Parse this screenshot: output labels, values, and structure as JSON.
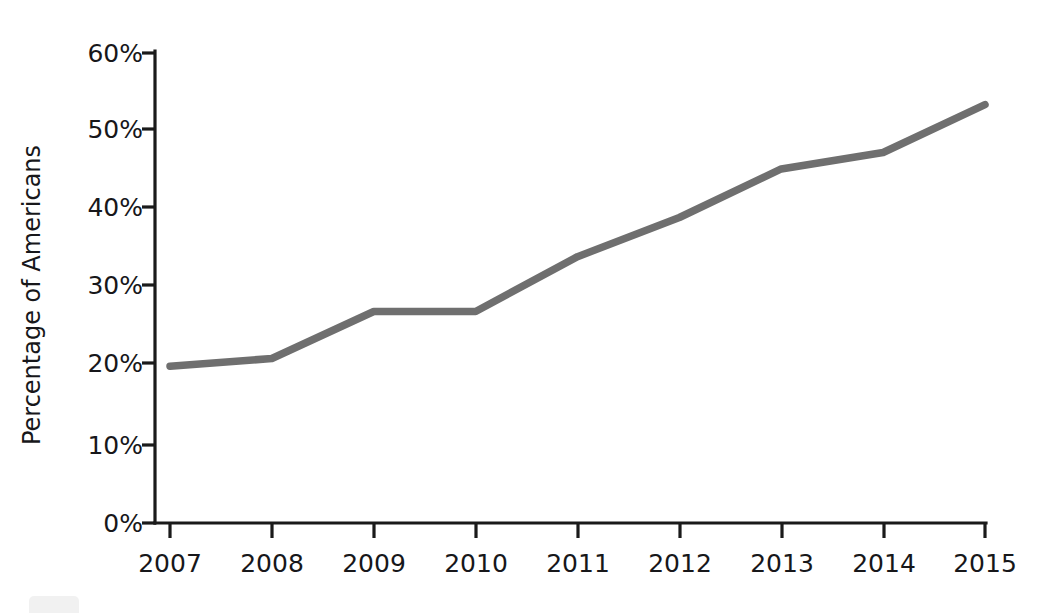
{
  "chart_data": {
    "type": "line",
    "title": "",
    "subtitle": "",
    "xlabel": "",
    "ylabel": "Percentage of Americans",
    "categories": [
      "2007",
      "2008",
      "2009",
      "2010",
      "2011",
      "2012",
      "2013",
      "2014",
      "2015"
    ],
    "x": [
      2007,
      2008,
      2009,
      2010,
      2011,
      2012,
      2013,
      2014,
      2015
    ],
    "values": [
      20,
      21,
      27,
      27,
      34,
      39,
      45.2,
      47.3,
      53.4
    ],
    "series": [
      {
        "name": "Percentage of Americans",
        "values": [
          20,
          21,
          27,
          27,
          34,
          39,
          45.2,
          47.3,
          53.4
        ],
        "color": "#6f6f6f"
      }
    ],
    "ylim": [
      0,
      60
    ],
    "xlim": [
      2007,
      2015
    ],
    "y_ticks": [
      0,
      10,
      20,
      30,
      40,
      50,
      60
    ],
    "y_tick_labels": [
      "0%",
      "10%",
      "20%",
      "30%",
      "40%",
      "50%",
      "60%"
    ],
    "x_ticks": [
      2007,
      2008,
      2009,
      2010,
      2011,
      2012,
      2013,
      2014,
      2015
    ],
    "x_tick_labels": [
      "2007",
      "2008",
      "2009",
      "2010",
      "2011",
      "2012",
      "2013",
      "2014",
      "2015"
    ],
    "grid": false,
    "legend": false,
    "legend_position": "none",
    "annotations": [],
    "axis_color": "#1a1a1a",
    "line_color": "#6f6f6f",
    "background_color": "#ffffff"
  },
  "axes": {
    "y_title": "Percentage of Americans",
    "x_title": "",
    "y_labels": [
      "60%",
      "50%",
      "40%",
      "30%",
      "20%",
      "10%",
      "0%"
    ],
    "x_labels": [
      "2007",
      "2008",
      "2009",
      "2010",
      "2011",
      "2012",
      "2013",
      "2014",
      "2015"
    ]
  }
}
